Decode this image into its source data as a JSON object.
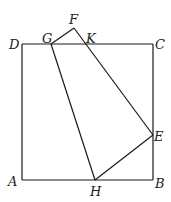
{
  "diagram": {
    "type": "geometry",
    "colors": {
      "stroke": "#1a1a1a",
      "label": "#222222",
      "background": "#ffffff"
    },
    "points": {
      "A": {
        "label": "A",
        "x": 22,
        "y": 180
      },
      "B": {
        "label": "B",
        "x": 153,
        "y": 180
      },
      "C": {
        "label": "C",
        "x": 153,
        "y": 44
      },
      "D": {
        "label": "D",
        "x": 22,
        "y": 44
      },
      "E": {
        "label": "E",
        "x": 153,
        "y": 135
      },
      "F": {
        "label": "F",
        "x": 74,
        "y": 28
      },
      "G": {
        "label": "G",
        "x": 51,
        "y": 44
      },
      "H": {
        "label": "H",
        "x": 95,
        "y": 180
      },
      "K": {
        "label": "K",
        "x": 87,
        "y": 44
      }
    },
    "segments": [
      [
        "A",
        "B"
      ],
      [
        "B",
        "C"
      ],
      [
        "C",
        "D"
      ],
      [
        "D",
        "A"
      ],
      [
        "G",
        "F"
      ],
      [
        "F",
        "E"
      ],
      [
        "E",
        "H"
      ],
      [
        "H",
        "G"
      ]
    ]
  }
}
